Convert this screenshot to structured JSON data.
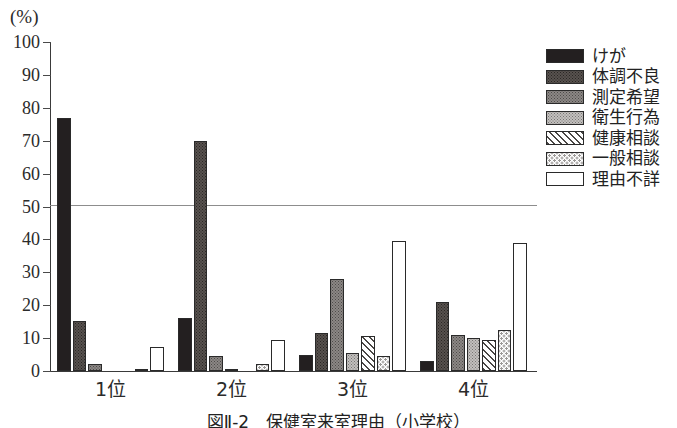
{
  "chart_data": {
    "type": "bar",
    "title": "図Ⅱ-2　保健室来室理由（小学校）",
    "xlabel": "",
    "ylabel": "(%)",
    "ylim": [
      0,
      100
    ],
    "ytick_step": 10,
    "grid": "single horizontal line at 50",
    "legend_position": "right",
    "categories": [
      "1位",
      "2位",
      "3位",
      "4位"
    ],
    "series": [
      {
        "name": "けが",
        "pattern": "solid-black",
        "values": [
          76.8,
          16.2,
          5.0,
          3.0
        ]
      },
      {
        "name": "体調不良",
        "pattern": "dark-gray",
        "values": [
          15.2,
          69.8,
          11.5,
          21.0
        ]
      },
      {
        "name": "測定希望",
        "pattern": "medium-gray",
        "values": [
          2.0,
          4.5,
          28.0,
          11.0
        ]
      },
      {
        "name": "衛生行為",
        "pattern": "light-gray",
        "values": [
          0.0,
          0.5,
          5.5,
          10.0
        ]
      },
      {
        "name": "健康相談",
        "pattern": "diagonal-hatch",
        "values": [
          0.0,
          0.0,
          10.5,
          9.5
        ]
      },
      {
        "name": "一般相談",
        "pattern": "sparse-dots",
        "values": [
          0.5,
          2.0,
          4.5,
          12.5
        ]
      },
      {
        "name": "理由不詳",
        "pattern": "white-empty",
        "values": [
          7.2,
          9.5,
          39.5,
          39.0
        ]
      }
    ],
    "yticks": [
      {
        "value": 100,
        "label": "100"
      },
      {
        "value": 90,
        "label": "90"
      },
      {
        "value": 80,
        "label": "80"
      },
      {
        "value": 70,
        "label": "70"
      },
      {
        "value": 60,
        "label": "60"
      },
      {
        "value": 50,
        "label": "50"
      },
      {
        "value": 40,
        "label": "40"
      },
      {
        "value": 30,
        "label": "30"
      },
      {
        "value": 20,
        "label": "20"
      },
      {
        "value": 10,
        "label": "10"
      },
      {
        "value": 0,
        "label": "0"
      }
    ],
    "colors": {
      "axis": "#3a3a3a",
      "gridline": "#8d8d8d",
      "text": "#222222",
      "keiga": "#231f20",
      "taicho": "#58524f",
      "sokutei": "#8b8785",
      "eisei": "#c2c0be",
      "kenkou": "#ffffff",
      "ippan": "#ffffff",
      "riyuu": "#ffffff"
    }
  }
}
